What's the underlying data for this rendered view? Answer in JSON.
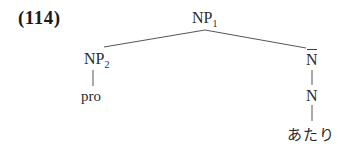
{
  "example": {
    "number": "(114)"
  },
  "tree": {
    "root": {
      "label": "NP",
      "subscript": "1"
    },
    "left": {
      "label": "NP",
      "subscript": "2",
      "child": "pro"
    },
    "right": {
      "label": "N",
      "bar": true,
      "child": {
        "label": "N",
        "child": "あたり"
      }
    }
  },
  "colors": {
    "text": "#2a2a2a",
    "lines": "#555555"
  }
}
